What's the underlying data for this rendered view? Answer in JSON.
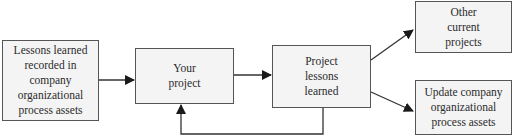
{
  "diagram": {
    "type": "flowchart",
    "nodes": [
      {
        "id": "org_assets_in",
        "label": "Lessons learned\nrecorded in\ncompany\norganizational\nprocess assets"
      },
      {
        "id": "your_project",
        "label": "Your\nproject"
      },
      {
        "id": "project_lessons",
        "label": "Project\nlessons\nlearned"
      },
      {
        "id": "other_projects",
        "label": "Other\ncurrent\nprojects"
      },
      {
        "id": "update_assets",
        "label": "Update company\norganizational\nprocess assets"
      }
    ],
    "edges": [
      {
        "from": "org_assets_in",
        "to": "your_project"
      },
      {
        "from": "your_project",
        "to": "project_lessons"
      },
      {
        "from": "project_lessons",
        "to": "other_projects"
      },
      {
        "from": "project_lessons",
        "to": "update_assets"
      },
      {
        "from": "project_lessons",
        "to": "your_project",
        "note": "feedback loop"
      }
    ],
    "colors": {
      "box_fill": "#f4f4f4",
      "box_border": "#555555",
      "arrow": "#1a1a1a",
      "text": "#2b2b2b"
    }
  }
}
